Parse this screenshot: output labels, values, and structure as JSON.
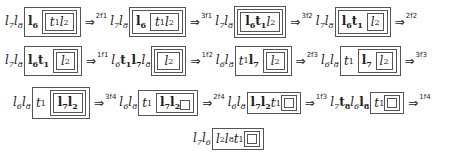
{
  "rows": [
    {
      "steps": [
        {
          "prefix": "l7l8",
          "arrow": "⇒",
          "label": "2f1"
        },
        {
          "prefix": "l7l8",
          "arrow": "⇒",
          "label": "3f1"
        },
        {
          "prefix": "l7l8",
          "arrow": "⇒",
          "label": "3f2"
        },
        {
          "prefix": "l7l8",
          "arrow": "⇒",
          "label": "2f2"
        }
      ]
    },
    {
      "steps": [
        {
          "prefix": "l7l8",
          "arrow": "⇒",
          "label": "1f1"
        },
        {
          "prefix": "l6t1l7l8",
          "arrow": "⇒",
          "label": "1f2"
        },
        {
          "prefix": "l6l8",
          "arrow": "⇒",
          "label": "2f3"
        },
        {
          "prefix": "l6l8",
          "arrow": "⇒",
          "label": "3f3"
        }
      ]
    },
    {
      "steps": [
        {
          "prefix": "l6l8",
          "arrow": "⇒",
          "label": "3f4"
        },
        {
          "prefix": "l6l8",
          "arrow": "⇒",
          "label": "2f4"
        },
        {
          "prefix": "l6l8",
          "arrow": "⇒",
          "label": "1f3"
        },
        {
          "prefix": "l7t8l6l8",
          "arrow": "⇒",
          "label": "1f4"
        }
      ]
    },
    {
      "steps": [
        {
          "prefix": "l7l6"
        }
      ]
    }
  ]
}
